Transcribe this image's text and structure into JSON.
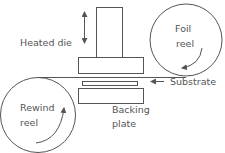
{
  "diagram": {
    "type": "hot-foil stamping process schematic",
    "colors": {
      "stroke": "#555555",
      "text": "#555555",
      "background": "#ffffff"
    },
    "labels": {
      "heated_die": "Heated die",
      "foil_reel_line1": "Foil",
      "foil_reel_line2": "reel",
      "rewind_reel_line1": "Rewind",
      "rewind_reel_line2": "reel",
      "substrate": "Substrate",
      "backing_plate_line1": "Backing",
      "backing_plate_line2": "plate"
    },
    "components": [
      {
        "id": "heated-die",
        "label": "Heated die",
        "motion": "vertical up/down (double arrow)"
      },
      {
        "id": "foil-reel",
        "label": "Foil reel",
        "rotation": "clockwise arrow"
      },
      {
        "id": "rewind-reel",
        "label": "Rewind reel",
        "rotation": "counter-clockwise arrow"
      },
      {
        "id": "foil-web",
        "label": "",
        "connects": [
          "foil-reel",
          "rewind-reel"
        ]
      },
      {
        "id": "substrate",
        "label": "Substrate"
      },
      {
        "id": "backing-plate",
        "label": "Backing plate"
      }
    ]
  }
}
